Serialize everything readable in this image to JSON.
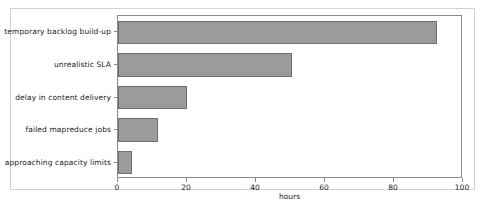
{
  "figure": {
    "background_color": "#ffffff",
    "border_color": "#d2d2d2",
    "axes_spine_color": "#8a8a8a",
    "bar_fill_color": "#9b9b9b",
    "bar_edge_color": "#6f6f6f"
  },
  "chart_data": {
    "type": "bar",
    "orientation": "horizontal",
    "title": "",
    "xlabel": "hours",
    "ylabel": "",
    "xlim": [
      0,
      100
    ],
    "xticks": [
      0,
      20,
      40,
      60,
      80,
      100
    ],
    "xticklabels": [
      "0",
      "20",
      "40",
      "60",
      "80",
      "100"
    ],
    "grid": false,
    "legend": false,
    "categories": [
      "temporary backlog build-up",
      "unrealistic SLA",
      "delay in content delivery",
      "failed mapreduce jobs",
      "approaching capacity limits"
    ],
    "values": [
      92.5,
      50.5,
      20,
      11.5,
      4
    ]
  }
}
